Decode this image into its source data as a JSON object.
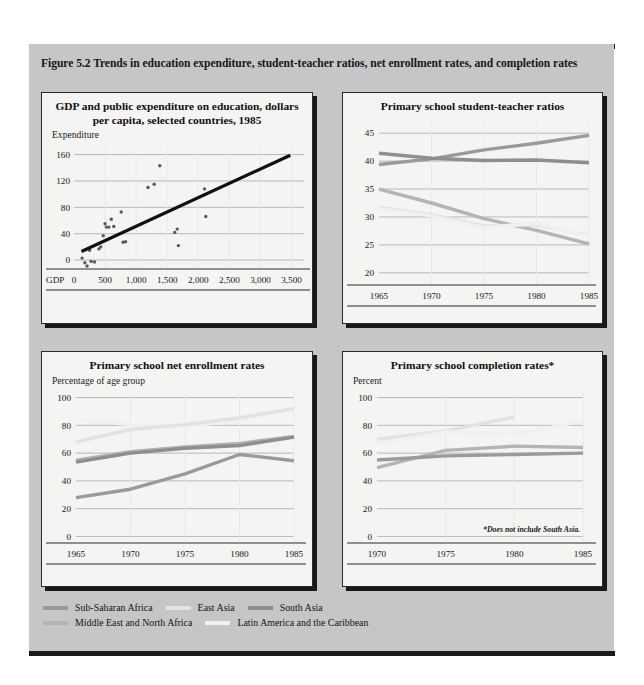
{
  "figure": {
    "caption": "Figure 5.2  Trends in education expenditure, student-teacher ratios, net enrollment rates, and completion rates",
    "panel_bg": "#c6c6c6",
    "card_bg": "#f4f4f2"
  },
  "series_colors": {
    "sub_saharan_africa": "#9a9a9a",
    "east_asia": "#e2e2e0",
    "south_asia": "#8e8e8e",
    "middle_east_north_africa": "#b4b4b4",
    "latin_america_caribbean": "#f0f0ee"
  },
  "legend": {
    "rows": [
      [
        {
          "label": "Sub-Saharan Africa",
          "color_key": "sub_saharan_africa",
          "swatch": "#9a9a9a"
        },
        {
          "label": "East Asia",
          "color_key": "east_asia",
          "swatch": "#e2e2e0"
        },
        {
          "label": "South Asia",
          "color_key": "south_asia",
          "swatch": "#8e8e8e"
        }
      ],
      [
        {
          "label": "Middle East and North Africa",
          "color_key": "middle_east_north_africa",
          "swatch": "#b4b4b4"
        },
        {
          "label": "Latin America and the Caribbean",
          "color_key": "latin_america_caribbean",
          "swatch": "#f0f0ee"
        }
      ]
    ]
  },
  "chart_data": [
    {
      "id": "gdp-expenditure",
      "type": "scatter",
      "title": "GDP and public expenditure on education, dollars per capita, selected countries, 1985",
      "ylabel": "Expenditure",
      "xlabel": "GDP",
      "xlim": [
        0,
        3700
      ],
      "ylim": [
        -12,
        170
      ],
      "yticks": [
        0,
        40,
        80,
        120,
        160
      ],
      "ytick_labels": [
        "0",
        "40",
        "80",
        "120",
        "160"
      ],
      "xticks": [
        0,
        500,
        1000,
        1500,
        2000,
        2500,
        3000,
        3500
      ],
      "xtick_labels": [
        "0",
        "500",
        "1,000",
        "1,500",
        "2,000",
        "2,500",
        "3,000",
        "3,500"
      ],
      "grid": true,
      "point_color": "#5a5a5a",
      "points": [
        {
          "x": 130,
          "y": 3
        },
        {
          "x": 175,
          "y": -4
        },
        {
          "x": 210,
          "y": -9
        },
        {
          "x": 250,
          "y": 15
        },
        {
          "x": 275,
          "y": -2
        },
        {
          "x": 330,
          "y": -3
        },
        {
          "x": 400,
          "y": 17
        },
        {
          "x": 430,
          "y": 20
        },
        {
          "x": 470,
          "y": 37
        },
        {
          "x": 500,
          "y": 55
        },
        {
          "x": 520,
          "y": 50
        },
        {
          "x": 560,
          "y": 50
        },
        {
          "x": 600,
          "y": 62
        },
        {
          "x": 640,
          "y": 51
        },
        {
          "x": 760,
          "y": 73
        },
        {
          "x": 790,
          "y": 27
        },
        {
          "x": 830,
          "y": 28
        },
        {
          "x": 1190,
          "y": 110
        },
        {
          "x": 1290,
          "y": 115
        },
        {
          "x": 1380,
          "y": 143
        },
        {
          "x": 1620,
          "y": 42
        },
        {
          "x": 1660,
          "y": 47
        },
        {
          "x": 1680,
          "y": 22
        },
        {
          "x": 2100,
          "y": 108
        },
        {
          "x": 2120,
          "y": 66
        }
      ],
      "trendline": {
        "x0": 120,
        "y0": 13,
        "x1": 3480,
        "y1": 159,
        "color": "#111111"
      }
    },
    {
      "id": "student-teacher-ratios",
      "type": "line",
      "title": "Primary school student-teacher ratios",
      "ylabel": "",
      "xlabel": "",
      "x": [
        1965,
        1970,
        1975,
        1980,
        1985
      ],
      "xtick_labels": [
        "1965",
        "1970",
        "1975",
        "1980",
        "1985"
      ],
      "yticks": [
        20,
        25,
        30,
        35,
        40,
        45
      ],
      "ytick_labels": [
        "20",
        "25",
        "30",
        "35",
        "40",
        "45"
      ],
      "ylim": [
        18,
        47
      ],
      "grid": true,
      "series": [
        {
          "name": "Sub-Saharan Africa",
          "color_key": "sub_saharan_africa",
          "color": "#9a9a9a",
          "values": [
            39.4,
            40.4,
            42.0,
            43.2,
            44.6
          ]
        },
        {
          "name": "South Asia",
          "color_key": "south_asia",
          "color": "#8e8e8e",
          "values": [
            41.4,
            40.5,
            40.1,
            40.2,
            39.7
          ]
        },
        {
          "name": "Middle East and North Africa",
          "color_key": "middle_east_north_africa",
          "color": "#b4b4b4",
          "values": [
            35.0,
            32.5,
            29.7,
            27.6,
            25.2
          ]
        },
        {
          "name": "East Asia",
          "color_key": "east_asia",
          "color": "#e2e2e0",
          "values": [
            31.7,
            30.4,
            28.4,
            28.6,
            26.7
          ]
        },
        {
          "name": "Latin America and the Caribbean",
          "color_key": "latin_america_caribbean",
          "color": "#f0f0ee",
          "values": [
            31.5,
            30.2,
            28.1,
            28.9,
            26.5
          ]
        }
      ]
    },
    {
      "id": "net-enrollment-rates",
      "type": "line",
      "title": "Primary school net enrollment rates",
      "ylabel": "Percentage of age group",
      "xlabel": "",
      "x": [
        1965,
        1970,
        1975,
        1980,
        1985
      ],
      "xtick_labels": [
        "1965",
        "1970",
        "1975",
        "1980",
        "1985"
      ],
      "yticks": [
        0,
        20,
        40,
        60,
        80,
        100
      ],
      "ytick_labels": [
        "0",
        "20",
        "40",
        "60",
        "80",
        "100"
      ],
      "ylim": [
        -4,
        104
      ],
      "grid": true,
      "series": [
        {
          "name": "Latin America and the Caribbean",
          "color_key": "latin_america_caribbean",
          "color": "#f0f0ee",
          "values": [
            84.0,
            80.5,
            79.5,
            83.0,
            93.0
          ]
        },
        {
          "name": "East Asia",
          "color_key": "east_asia",
          "color": "#e2e2e0",
          "values": [
            68.0,
            77.0,
            80.5,
            85.5,
            92.0
          ]
        },
        {
          "name": "Middle East and North Africa",
          "color_key": "middle_east_north_africa",
          "color": "#b4b4b4",
          "values": [
            55.0,
            61.0,
            64.5,
            67.0,
            72.0
          ]
        },
        {
          "name": "South Asia",
          "color_key": "south_asia",
          "color": "#8e8e8e",
          "values": [
            53.5,
            60.0,
            63.5,
            65.5,
            71.5
          ]
        },
        {
          "name": "Sub-Saharan Africa",
          "color_key": "sub_saharan_africa",
          "color": "#9a9a9a",
          "values": [
            28.0,
            34.0,
            45.0,
            59.0,
            54.5
          ]
        }
      ]
    },
    {
      "id": "completion-rates",
      "type": "line",
      "title": "Primary school completion rates*",
      "ylabel": "Percent",
      "xlabel": "",
      "annotation": "*Does not include South Asia.",
      "x": [
        1970,
        1975,
        1980,
        1985
      ],
      "xtick_labels": [
        "1970",
        "1975",
        "1980",
        "1985"
      ],
      "yticks": [
        0,
        20,
        40,
        60,
        80,
        100
      ],
      "ytick_labels": [
        "0",
        "20",
        "40",
        "60",
        "80",
        "100"
      ],
      "ylim": [
        -4,
        104
      ],
      "grid": true,
      "series": [
        {
          "name": "East Asia",
          "color_key": "east_asia",
          "color": "#e2e2e0",
          "values": [
            70.0,
            76.0,
            86.0,
            null
          ]
        },
        {
          "name": "Latin America and the Caribbean",
          "color_key": "latin_america_caribbean",
          "color": "#f0f0ee",
          "values": [
            67.0,
            75.5,
            73.5,
            83.0
          ]
        },
        {
          "name": "Middle East and North Africa",
          "color_key": "middle_east_north_africa",
          "color": "#b4b4b4",
          "values": [
            49.5,
            62.0,
            65.0,
            64.0
          ]
        },
        {
          "name": "Sub-Saharan Africa",
          "color_key": "sub_saharan_africa",
          "color": "#9a9a9a",
          "values": [
            55.0,
            58.0,
            59.0,
            60.0
          ]
        }
      ]
    }
  ]
}
